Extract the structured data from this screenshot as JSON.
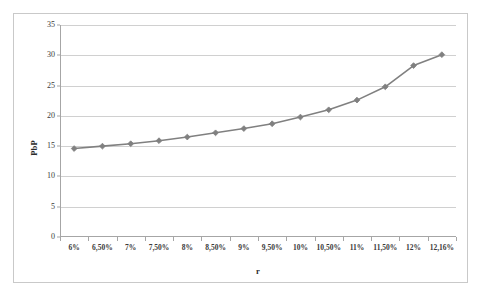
{
  "chart_data": {
    "type": "line",
    "title": "",
    "subtitle": "",
    "xlabel": "r",
    "ylabel": "PbP",
    "categories": [
      "6%",
      "6,50%",
      "7%",
      "7,50%",
      "8%",
      "8,50%",
      "9%",
      "9,50%",
      "10%",
      "10,50%",
      "11%",
      "11,50%",
      "12%",
      "12,16%"
    ],
    "values": [
      14.6,
      15.0,
      15.4,
      15.9,
      16.5,
      17.2,
      17.9,
      18.7,
      19.8,
      21.0,
      22.6,
      24.8,
      28.3,
      30.1
    ],
    "series": [
      {
        "name": "PbP",
        "values": [
          14.6,
          15.0,
          15.4,
          15.9,
          16.5,
          17.2,
          17.9,
          18.7,
          19.8,
          21.0,
          22.6,
          24.8,
          28.3,
          30.1
        ]
      }
    ],
    "ylim": [
      0,
      35
    ],
    "ytick_step": 5,
    "yticks": [
      0,
      5,
      10,
      15,
      20,
      25,
      30,
      35
    ],
    "ytick_labels": [
      "0",
      "5",
      "10",
      "15",
      "20",
      "25",
      "30",
      "35"
    ],
    "grid": "horizontal",
    "legend": "none",
    "marker": "diamond",
    "colors": {
      "series_line": "#808080",
      "series_marker": "#808080",
      "gridline": "#d0d0d0",
      "axis": "#a6a6a6",
      "frame_border": "#c9c9c9",
      "plot_background": "#ffffff",
      "text": "#3a3a3a"
    }
  }
}
